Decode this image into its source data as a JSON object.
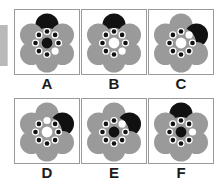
{
  "figure": {
    "type": "multiple-choice-shape-panels",
    "rows": 2,
    "columns": 3,
    "colors": {
      "petal_gray": "#9a9a9a",
      "petal_black": "#111111",
      "center_black": "#111111",
      "center_white": "#ffffff",
      "dot_black": "#111111",
      "dot_white": "#ffffff",
      "panel_border": "#9a9a9a",
      "background": "#ffffff",
      "edge_bar": "#b9b9b9",
      "label_text": "#1b1b1b"
    },
    "edge_bar_label": "left-edge-gray-bar",
    "panels": [
      {
        "id": "A",
        "label": "A",
        "petal_count": 6,
        "black_petal_position": "top",
        "center_fill": "black",
        "ring_dot_count": 8,
        "white_dot_position": "lower-right",
        "description": "Flower with black top petal, black center, one white dot at lower right of ring"
      },
      {
        "id": "B",
        "label": "B",
        "petal_count": 6,
        "black_petal_position": "top",
        "center_fill": "white",
        "ring_dot_count": 8,
        "white_dot_position": "lower-right",
        "description": "Flower with black top petal, white center, one white dot at lower right of ring"
      },
      {
        "id": "C",
        "label": "C",
        "petal_count": 6,
        "black_petal_position": "upper-right",
        "center_fill": "white",
        "ring_dot_count": 8,
        "white_dot_position": "upper-right",
        "description": "Flower with black upper-right petal, white center, one white dot at upper right of ring"
      },
      {
        "id": "D",
        "label": "D",
        "petal_count": 6,
        "black_petal_position": "upper-right",
        "center_fill": "white",
        "ring_dot_count": 8,
        "white_dot_position": "top",
        "description": "Flower with black upper-right petal, white center, one white dot at top of ring"
      },
      {
        "id": "E",
        "label": "E",
        "petal_count": 6,
        "black_petal_position": "upper-right",
        "center_fill": "black",
        "ring_dot_count": 8,
        "white_dot_position": "upper-right",
        "description": "Flower with black upper-right petal, black center, one white dot at upper right of ring"
      },
      {
        "id": "F",
        "label": "F",
        "petal_count": 6,
        "black_petal_position": "top",
        "center_fill": "black",
        "ring_dot_count": 8,
        "white_dot_position": "right",
        "description": "Flower with black top petal, black center, one white dot at right of ring"
      }
    ]
  }
}
